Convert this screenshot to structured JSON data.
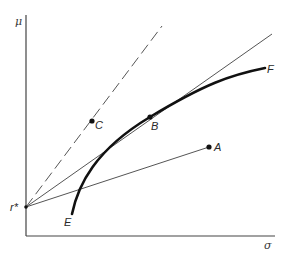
{
  "diagram": {
    "type": "mean-variance efficient frontier with risk-free asset",
    "colors": {
      "ink": "#1a1a1a",
      "thin": "#555555",
      "background": "#ffffff"
    },
    "axes": {
      "y_label": "μ",
      "x_label": "σ",
      "origin_label": "r*"
    },
    "points": {
      "A": {
        "label": "A"
      },
      "B": {
        "label": "B"
      },
      "C": {
        "label": "C"
      }
    },
    "curve": {
      "start_label": "E",
      "end_label": "F",
      "style": "thick solid"
    },
    "lines": [
      {
        "name": "line-r-to-A",
        "from": "r*",
        "to": "A",
        "style": "thin solid"
      },
      {
        "name": "tangent-line-r-through-B",
        "from": "r*",
        "through": "B",
        "style": "thin solid"
      },
      {
        "name": "line-r-through-C",
        "from": "r*",
        "through": "C",
        "style": "dashed"
      }
    ]
  }
}
